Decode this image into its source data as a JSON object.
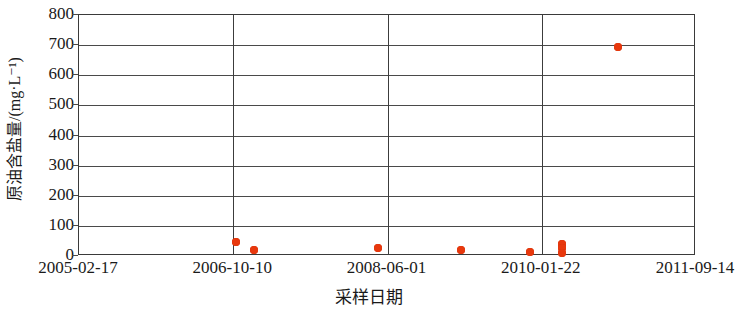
{
  "chart_data": {
    "type": "scatter",
    "title": "",
    "xlabel": "采样日期",
    "ylabel": "原油含盐量/(mg·L⁻¹)",
    "ylim": [
      0,
      800
    ],
    "y_ticks": [
      0,
      100,
      200,
      300,
      400,
      500,
      600,
      700,
      800
    ],
    "y_tick_labels": [
      "0",
      "100",
      "200",
      "300",
      "400",
      "500",
      "600",
      "700",
      "800"
    ],
    "x_tick_labels": [
      "2005-02-17",
      "2006-10-10",
      "2008-06-01",
      "2010-01-22",
      "2011-09-14"
    ],
    "x_tick_positions": [
      0,
      0.25,
      0.5,
      0.75,
      1.0
    ],
    "grid": "horizontal-and-vertical",
    "legend": "none",
    "marker_color": "#e8380d",
    "axis_color": "#3a3a3a",
    "points": [
      {
        "x_frac": 0.256,
        "y": 43
      },
      {
        "x_frac": 0.285,
        "y": 17
      },
      {
        "x_frac": 0.487,
        "y": 22
      },
      {
        "x_frac": 0.62,
        "y": 18
      },
      {
        "x_frac": 0.733,
        "y": 10
      },
      {
        "x_frac": 0.785,
        "y": 36
      },
      {
        "x_frac": 0.785,
        "y": 22
      },
      {
        "x_frac": 0.785,
        "y": 8
      },
      {
        "x_frac": 0.876,
        "y": 690
      }
    ]
  },
  "axes": {
    "y_title": "原油含盐量/(mg·L⁻¹)",
    "x_title": "采样日期"
  }
}
